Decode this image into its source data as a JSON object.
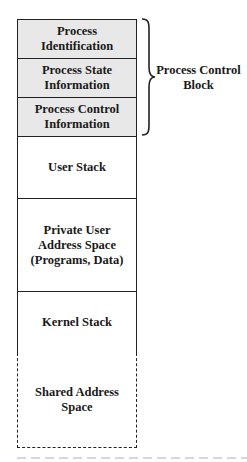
{
  "diagram": {
    "sections": [
      {
        "id": "process-identification",
        "label": "Process\nIdentification",
        "group": "pcb",
        "style": "shaded"
      },
      {
        "id": "process-state-information",
        "label": "Process State\nInformation",
        "group": "pcb",
        "style": "shaded"
      },
      {
        "id": "process-control-information",
        "label": "Process Control\nInformation",
        "group": "pcb",
        "style": "shaded"
      },
      {
        "id": "user-stack",
        "label": "User Stack",
        "group": null,
        "style": "solid"
      },
      {
        "id": "private-user-address-space",
        "label": "Private User\nAddress Space\n(Programs, Data)",
        "group": null,
        "style": "solid"
      },
      {
        "id": "kernel-stack",
        "label": "Kernel Stack",
        "group": null,
        "style": "solid"
      },
      {
        "id": "shared-address-space",
        "label": "Shared Address\nSpace",
        "group": null,
        "style": "dashed"
      }
    ],
    "brace_label": "Process Control\nBlock",
    "caption_visible": "clipped (illegible)"
  },
  "colors": {
    "pcb_fill": "#e8e8e8",
    "border": "#222222",
    "background": "#ffffff"
  }
}
